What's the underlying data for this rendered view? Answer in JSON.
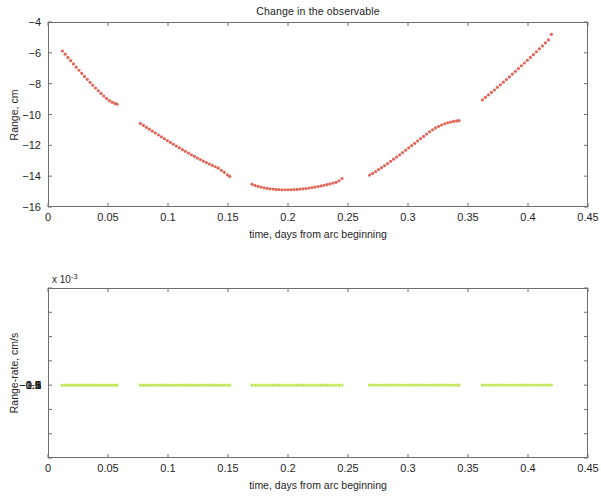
{
  "figure": {
    "title": "Change in the observable",
    "background": "#ffffff",
    "axis_color": "#6f6f6f"
  },
  "chart_data": [
    {
      "type": "scatter",
      "id": "range-plot",
      "title": "Change in the observable",
      "xlabel": "time, days from arc beginning",
      "ylabel": "Range, cm",
      "xlim": [
        0,
        0.45
      ],
      "ylim": [
        -16,
        -4
      ],
      "xticks": [
        0,
        0.05,
        0.1,
        0.15,
        0.2,
        0.25,
        0.3,
        0.35,
        0.4,
        0.45
      ],
      "xticklabels": [
        "0",
        "0.05",
        "0.1",
        "0.15",
        "0.2",
        "0.25",
        "0.3",
        "0.35",
        "0.4",
        "0.45"
      ],
      "yticks": [
        -4,
        -6,
        -8,
        -10,
        -12,
        -14,
        -16
      ],
      "yticklabels": [
        "-4",
        "-6",
        "-8",
        "-10",
        "-12",
        "-14",
        "-16"
      ],
      "grid": false,
      "legend": null,
      "marker": "dot",
      "marker_size": 1.6,
      "color": "#e0685a",
      "series": [
        {
          "name": "Range",
          "segments": [
            {
              "x": [
                0.012,
                0.0143,
                0.0166,
                0.0189,
                0.0212,
                0.0235,
                0.0258,
                0.0281,
                0.0304,
                0.0327,
                0.035,
                0.0373,
                0.0396,
                0.0419,
                0.0442,
                0.0465,
                0.0488,
                0.0511,
                0.0534,
                0.0557,
                0.0575
              ],
              "y": [
                -5.88,
                -6.09,
                -6.3,
                -6.51,
                -6.72,
                -6.93,
                -7.13,
                -7.33,
                -7.53,
                -7.72,
                -7.91,
                -8.1,
                -8.28,
                -8.46,
                -8.63,
                -8.8,
                -8.96,
                -9.1,
                -9.2,
                -9.28,
                -9.33
              ]
            },
            {
              "x": [
                0.077,
                0.0795,
                0.082,
                0.0845,
                0.087,
                0.0895,
                0.092,
                0.0945,
                0.097,
                0.0995,
                0.102,
                0.1045,
                0.107,
                0.1095,
                0.112,
                0.1145,
                0.117,
                0.1195,
                0.122,
                0.1245,
                0.127,
                0.1295,
                0.132,
                0.1345,
                0.137,
                0.1395,
                0.142,
                0.1445,
                0.147,
                0.1495,
                0.1515
              ],
              "y": [
                -10.58,
                -10.7,
                -10.83,
                -10.95,
                -11.08,
                -11.2,
                -11.33,
                -11.45,
                -11.57,
                -11.69,
                -11.81,
                -11.93,
                -12.05,
                -12.16,
                -12.28,
                -12.39,
                -12.5,
                -12.61,
                -12.71,
                -12.82,
                -12.92,
                -13.02,
                -13.12,
                -13.21,
                -13.3,
                -13.39,
                -13.48,
                -13.62,
                -13.75,
                -13.92,
                -14.02
              ]
            },
            {
              "x": [
                0.17,
                0.1725,
                0.175,
                0.1775,
                0.18,
                0.1825,
                0.185,
                0.1875,
                0.19,
                0.1925,
                0.195,
                0.1975,
                0.2,
                0.2025,
                0.205,
                0.2075,
                0.21,
                0.2125,
                0.215,
                0.2175,
                0.22,
                0.2225,
                0.225,
                0.2275,
                0.23,
                0.2325,
                0.235,
                0.2375,
                0.24,
                0.2425,
                0.245
              ],
              "y": [
                -14.52,
                -14.6,
                -14.66,
                -14.71,
                -14.75,
                -14.79,
                -14.82,
                -14.84,
                -14.86,
                -14.87,
                -14.88,
                -14.88,
                -14.88,
                -14.88,
                -14.87,
                -14.86,
                -14.84,
                -14.82,
                -14.8,
                -14.77,
                -14.74,
                -14.71,
                -14.67,
                -14.63,
                -14.59,
                -14.55,
                -14.5,
                -14.45,
                -14.4,
                -14.3,
                -14.15
              ]
            },
            {
              "x": [
                0.268,
                0.2705,
                0.273,
                0.2755,
                0.278,
                0.2805,
                0.283,
                0.2855,
                0.288,
                0.2905,
                0.293,
                0.2955,
                0.298,
                0.3005,
                0.303,
                0.3055,
                0.308,
                0.3105,
                0.313,
                0.3155,
                0.318,
                0.3205,
                0.323,
                0.3255,
                0.328,
                0.3305,
                0.333,
                0.3355,
                0.338,
                0.3405,
                0.3425
              ],
              "y": [
                -13.93,
                -13.82,
                -13.7,
                -13.57,
                -13.44,
                -13.31,
                -13.18,
                -13.04,
                -12.9,
                -12.76,
                -12.62,
                -12.47,
                -12.32,
                -12.17,
                -12.02,
                -11.87,
                -11.72,
                -11.57,
                -11.42,
                -11.27,
                -11.12,
                -10.99,
                -10.87,
                -10.77,
                -10.68,
                -10.6,
                -10.54,
                -10.49,
                -10.45,
                -10.42,
                -10.4
              ]
            },
            {
              "x": [
                0.362,
                0.3645,
                0.367,
                0.3695,
                0.372,
                0.3745,
                0.377,
                0.3795,
                0.382,
                0.3845,
                0.387,
                0.3895,
                0.392,
                0.3945,
                0.397,
                0.3995,
                0.402,
                0.4045,
                0.407,
                0.4095,
                0.412,
                0.4145,
                0.417,
                0.4195
              ],
              "y": [
                -9.05,
                -8.89,
                -8.73,
                -8.57,
                -8.41,
                -8.24,
                -8.07,
                -7.9,
                -7.73,
                -7.56,
                -7.38,
                -7.2,
                -7.02,
                -6.84,
                -6.66,
                -6.48,
                -6.3,
                -6.12,
                -5.93,
                -5.74,
                -5.55,
                -5.36,
                -5.16,
                -4.8
              ]
            }
          ]
        }
      ]
    },
    {
      "type": "scatter",
      "id": "range-rate-plot",
      "title": "",
      "xlabel": "time, days from arc beginning",
      "ylabel": "Range-rate, cm/s",
      "y_multiplier_text": "x 10",
      "y_multiplier_exponent": "-3",
      "xlim": [
        0,
        0.45
      ],
      "ylim": [
        -1.5,
        2
      ],
      "xticks": [
        0,
        0.05,
        0.1,
        0.15,
        0.2,
        0.25,
        0.3,
        0.35,
        0.4,
        0.45
      ],
      "xticklabels": [
        "0",
        "0.05",
        "0.1",
        "0.15",
        "0.2",
        "0.25",
        "0.3",
        "0.35",
        "0.4",
        "0.45"
      ],
      "yticks": [
        2,
        1.5,
        1,
        0.5,
        0,
        -0.5,
        -1,
        -1.5
      ],
      "yticklabels": [
        "2",
        "1.5",
        "1",
        "0.5",
        "0",
        "-0.5",
        "-1",
        "-1.5"
      ],
      "grid": false,
      "legend": null,
      "marker": "dot",
      "marker_size": 1.6,
      "color": "#c2e85a",
      "series": [
        {
          "name": "Range-rate",
          "segments": [
            {
              "x": [
                0.012,
                0.0143,
                0.0166,
                0.0189,
                0.0212,
                0.0235,
                0.0258,
                0.0281,
                0.0304,
                0.0327,
                0.035,
                0.0373,
                0.0396,
                0.0419,
                0.0442,
                0.0465,
                0.0488,
                0.0511,
                0.0534,
                0.0557,
                0.0575
              ],
              "y": [
                -1.47,
                -1.464,
                -1.457,
                -1.45,
                -1.441,
                -1.432,
                -1.422,
                -1.411,
                -1.399,
                -1.387,
                -1.374,
                -1.36,
                -1.346,
                -1.331,
                -1.326,
                -1.318,
                -1.31,
                -1.3,
                -1.29,
                -1.28,
                -1.272
              ]
            },
            {
              "x": [
                0.077,
                0.0795,
                0.082,
                0.0845,
                0.087,
                0.0895,
                0.092,
                0.0945,
                0.097,
                0.0995,
                0.102,
                0.1045,
                0.107,
                0.1095,
                0.112,
                0.1145,
                0.117,
                0.1195,
                0.122,
                0.1245,
                0.127,
                0.1295,
                0.132,
                0.1345,
                0.137,
                0.1395,
                0.142,
                0.1445,
                0.147,
                0.1495,
                0.1515
              ],
              "y": [
                -1.13,
                -1.108,
                -1.085,
                -1.062,
                -1.039,
                -1.015,
                -0.991,
                -0.967,
                -0.943,
                -0.919,
                -0.895,
                -0.871,
                -0.847,
                -0.823,
                -0.8,
                -0.777,
                -0.754,
                -0.731,
                -0.709,
                -0.687,
                -0.666,
                -0.645,
                -0.625,
                -0.606,
                -0.588,
                -0.571,
                -0.558,
                -0.55,
                -0.545,
                -0.542,
                -0.54
              ]
            },
            {
              "x": [
                0.17,
                0.1725,
                0.175,
                0.1775,
                0.18,
                0.1825,
                0.185,
                0.1875,
                0.19,
                0.1925,
                0.195,
                0.1975,
                0.2,
                0.2025,
                0.205,
                0.2075,
                0.21,
                0.2125,
                0.215,
                0.2175,
                0.22,
                0.2225,
                0.225,
                0.2275,
                0.23,
                0.2325,
                0.235,
                0.2375,
                0.24,
                0.2425,
                0.245
              ],
              "y": [
                -0.33,
                -0.307,
                -0.284,
                -0.261,
                -0.238,
                -0.215,
                -0.192,
                -0.169,
                -0.146,
                -0.123,
                -0.1,
                -0.077,
                -0.054,
                -0.031,
                -0.008,
                0.015,
                0.038,
                0.061,
                0.084,
                0.107,
                0.13,
                0.153,
                0.176,
                0.199,
                0.222,
                0.245,
                0.268,
                0.291,
                0.314,
                0.337,
                0.355
              ]
            },
            {
              "x": [
                0.268,
                0.2705,
                0.273,
                0.2755,
                0.278,
                0.2805,
                0.283,
                0.2855,
                0.288,
                0.2905,
                0.293,
                0.2955,
                0.298,
                0.3005,
                0.303,
                0.3055,
                0.308,
                0.3105,
                0.313,
                0.3155,
                0.318,
                0.3205,
                0.323,
                0.3255,
                0.328,
                0.3305,
                0.333,
                0.3355,
                0.338,
                0.3405,
                0.3425
              ],
              "y": [
                0.575,
                0.596,
                0.617,
                0.638,
                0.659,
                0.68,
                0.701,
                0.722,
                0.743,
                0.764,
                0.785,
                0.806,
                0.827,
                0.848,
                0.869,
                0.89,
                0.911,
                0.932,
                0.953,
                0.974,
                0.995,
                1.016,
                1.037,
                1.058,
                1.079,
                1.1,
                1.115,
                1.13,
                1.145,
                1.16,
                1.17
              ]
            },
            {
              "x": [
                0.362,
                0.3645,
                0.367,
                0.3695,
                0.372,
                0.3745,
                0.377,
                0.3795,
                0.382,
                0.3845,
                0.387,
                0.3895,
                0.392,
                0.3945,
                0.397,
                0.3995,
                0.402,
                0.4045,
                0.407,
                0.4095,
                0.412,
                0.4145,
                0.417,
                0.4195
              ],
              "y": [
                1.29,
                1.3,
                1.311,
                1.321,
                1.332,
                1.342,
                1.353,
                1.363,
                1.374,
                1.384,
                1.395,
                1.405,
                1.416,
                1.426,
                1.437,
                1.447,
                1.458,
                1.468,
                1.477,
                1.486,
                1.494,
                1.501,
                1.507,
                1.512
              ]
            }
          ]
        }
      ]
    }
  ]
}
